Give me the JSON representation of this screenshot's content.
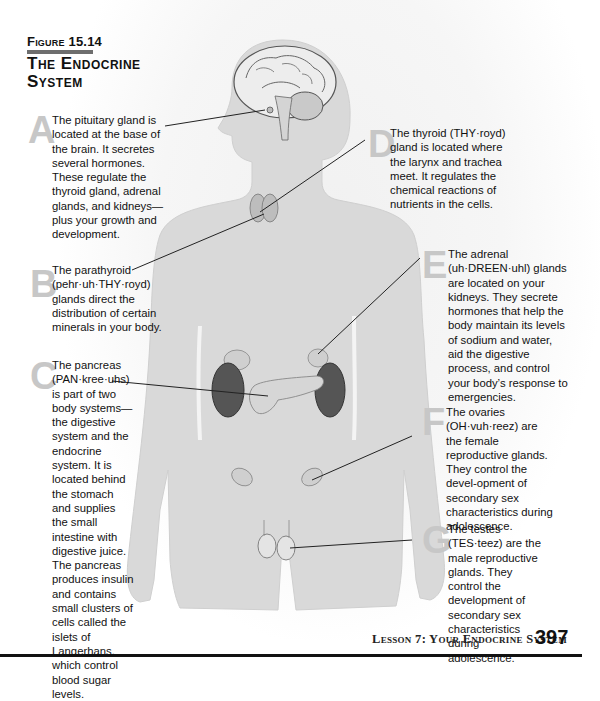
{
  "figure": {
    "label": "Figure 15.14",
    "title": "The Endocrine System"
  },
  "callouts": [
    {
      "letter": "A",
      "gland": "pituitary",
      "text": "The pituitary gland is located at the base of the brain. It secretes several hormones. These regulate the thyroid gland, adrenal glands, and kidneys—plus your growth and development."
    },
    {
      "letter": "B",
      "gland": "parathyroid",
      "text": "The parathyroid (pehr·uh·THY·royd) glands direct the distribution of certain minerals in your body."
    },
    {
      "letter": "C",
      "gland": "pancreas",
      "text": "The pancreas (PAN·kree·uhs) is part of two body systems—the digestive system and the endocrine system. It is located behind the stomach and supplies the small intestine with digestive juice. The pancreas produces insulin and contains small clusters of cells called the islets of Langerhans, which control blood sugar levels."
    },
    {
      "letter": "D",
      "gland": "thyroid",
      "text": "The thyroid (THY·royd) gland is located where the larynx and trachea meet. It regulates the chemical reactions of nutrients in the cells."
    },
    {
      "letter": "E",
      "gland": "adrenal",
      "text": "The adrenal (uh·DREEN·uhl) glands are located on your kidneys. They secrete hormones that help the body maintain its levels of sodium and water, aid the digestive process, and control your body’s response to emergencies."
    },
    {
      "letter": "F",
      "gland": "ovaries",
      "text": "The ovaries (OH·vuh·reez) are the female reproductive glands. They control the devel-opment of secondary sex characteristics during adolescence."
    },
    {
      "letter": "G",
      "gland": "testes",
      "text": "The testes (TES·teez) are the male reproductive glands. They control the development of secondary sex characteristics during adolescence."
    }
  ],
  "footer": {
    "running_head": "Lesson 7: Your Endocrine System",
    "page_number": "397"
  },
  "colors": {
    "body_fill": "#d9d9d9",
    "letter_gray": "#c7c7c7",
    "kidney": "#555555",
    "gland_fill": "#bdbdbd"
  }
}
